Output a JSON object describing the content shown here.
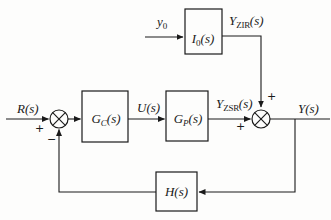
{
  "colors": {
    "ink": "#1a1a1a",
    "paper": "#fdfdfc"
  },
  "blocks": {
    "i0": {
      "pre": "I",
      "sub": "0",
      "post": "(s)"
    },
    "gc": {
      "pre": "G",
      "sub": "C",
      "post": "(s)"
    },
    "gp": {
      "pre": "G",
      "sub": "P",
      "post": "(s)"
    },
    "h": {
      "pre": "H",
      "sub": "",
      "post": "(s)"
    }
  },
  "labels": {
    "y0": {
      "pre": "y",
      "sub": "0",
      "post": ""
    },
    "yzir": {
      "pre": "Y",
      "sub": "ZIR",
      "post": "(s)"
    },
    "r": {
      "pre": "R",
      "sub": "",
      "post": "(s)"
    },
    "u": {
      "pre": "U",
      "sub": "",
      "post": "(s)"
    },
    "yzsr": {
      "pre": "Y",
      "sub": "ZSR",
      "post": "(s)"
    },
    "y": {
      "pre": "Y",
      "sub": "",
      "post": "(s)"
    }
  },
  "signs": {
    "sum1_plus": "+",
    "sum1_minus": "−",
    "sum2_plus_left": "+",
    "sum2_plus_top": "+"
  }
}
